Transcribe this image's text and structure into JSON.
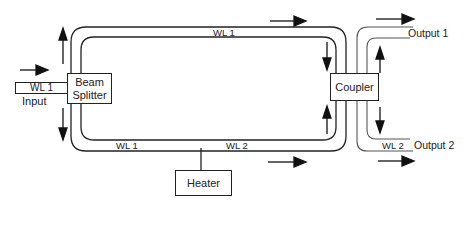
{
  "diagram": {
    "components": {
      "beam_splitter": "Beam Splitter",
      "coupler": "Coupler",
      "heater": "Heater"
    },
    "labels": {
      "input_wl": "WL 1",
      "input": "Input",
      "top_arm_wl": "WL 1",
      "bottom_arm_wl_left": "WL 1",
      "bottom_arm_wl_right": "WL 2",
      "output_2_wl": "WL 2",
      "output_1": "Output 1",
      "output_2": "Output 2"
    },
    "colors": {
      "line": "#222222",
      "output_line": "#555555",
      "background": "#ffffff"
    }
  }
}
